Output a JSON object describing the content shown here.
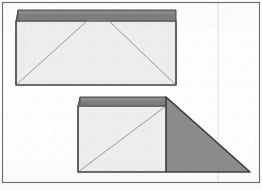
{
  "document": {
    "kind": "scanned-line-drawing",
    "title": "Roof plan diagrams",
    "width": 262,
    "height": 190,
    "background_color": "#fdfdfd"
  },
  "palette": {
    "paper": "#fdfdfd",
    "frame_stroke": "#6b6b6b",
    "outline_stroke": "#4a4a4a",
    "diagonal_stroke": "#8e8e8e",
    "light_fill": "#e9e9e9",
    "light_fill_alt": "#ededed",
    "dark_band_fill": "#7e7e7e",
    "dark_band_fill_alt": "#858585",
    "triangle_fill": "#8b8b8b",
    "fold_line": "#dcdcdc"
  },
  "frame": {
    "name": "outer-border",
    "x": 2.5,
    "y": 2.5,
    "width": 257,
    "height": 180,
    "stroke_width": 1.1,
    "stroke": "#6b6b6b"
  },
  "fold_line": {
    "name": "vertical-fold-crease",
    "x": 218,
    "y_top": 3,
    "y_bottom": 182,
    "stroke": "#dcdcdc",
    "stroke_width": 1
  },
  "figures": [
    {
      "id": "figure-top",
      "name": "hip-roof-plan-rectangular",
      "description": "Rectangular hip roof plan with full ridge and four hip lines",
      "body": {
        "points": "16,21 176,21 176,85 16,85",
        "fill": "#ededed",
        "stroke": "#4a4a4a",
        "stroke_width": 1.1
      },
      "ridge_band": {
        "name": "ridge-band-dark",
        "points": "16,21 176,21 176,10 18,10",
        "fill": "#7e7e7e",
        "stroke": "#4a4a4a",
        "stroke_width": 1.0
      },
      "band_highlight": {
        "points": "18,11 175,11 175,13 18,13",
        "fill": "#9a9a9a"
      },
      "hip_lines": [
        {
          "name": "hip-line-left",
          "x1": 16,
          "y1": 85,
          "x2": 87,
          "y2": 21
        },
        {
          "name": "hip-line-right",
          "x1": 176,
          "y1": 85,
          "x2": 109,
          "y2": 21
        },
        {
          "name": "ridge-line-horizontal",
          "x1": 87,
          "y1": 21,
          "x2": 109,
          "y2": 21
        }
      ],
      "diagonal_stroke": "#8e8e8e",
      "diagonal_stroke_width": 0.9
    },
    {
      "id": "figure-bottom",
      "name": "shed-roof-plan-with-slope",
      "description": "Shed roof plan: rectangular block on the left with a large sloping right triangle extending to the right",
      "body": {
        "points": "78,106 166,106 166,172 78,172",
        "fill": "#ededed",
        "stroke": "#4a4a4a",
        "stroke_width": 1.1
      },
      "ridge_band": {
        "name": "ridge-band-dark",
        "points": "78,106 166,106 166,97 80,97",
        "fill": "#7e7e7e",
        "stroke": "#4a4a4a",
        "stroke_width": 1.0
      },
      "band_highlight": {
        "points": "80,98 165,98 165,100 80,100",
        "fill": "#9a9a9a"
      },
      "slope_triangle": {
        "name": "slope-face-triangle",
        "points": "166,97 250,172 166,172",
        "fill": "#8b8b8b",
        "stroke": "#4a4a4a",
        "stroke_width": 1.1
      },
      "hip_lines": [
        {
          "name": "hip-line-diagonal",
          "x1": 78,
          "y1": 172,
          "x2": 166,
          "y2": 106
        }
      ],
      "diagonal_stroke": "#8e8e8e",
      "diagonal_stroke_width": 0.9
    }
  ]
}
